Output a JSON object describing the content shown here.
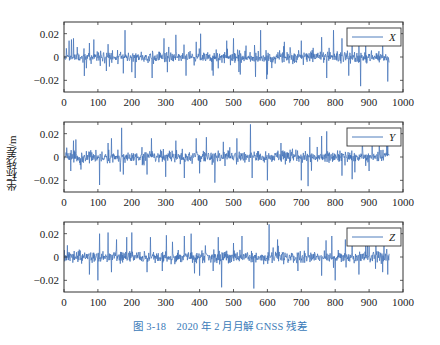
{
  "figure": {
    "caption": "图 3-18　2020 年 2 月月解 GNSS 残差",
    "ylabel": "坐标残差/m",
    "line_color": "#3d6fb6",
    "axis_color": "#333333",
    "caption_color": "#3a7ab8"
  },
  "chart_data": [
    {
      "type": "line",
      "title": "",
      "legend": "X",
      "xlabel": "",
      "ylabel": "坐标残差/m",
      "xlim": [
        0,
        1000
      ],
      "ylim": [
        -0.03,
        0.03
      ],
      "xticks": [
        0,
        100,
        200,
        300,
        400,
        500,
        600,
        700,
        800,
        900,
        1000
      ],
      "yticks": [
        -0.02,
        0,
        0.02
      ],
      "ytick_labels": [
        "-0.02",
        "0",
        "0.02"
      ],
      "n_points": 960,
      "noise_std": 0.003,
      "seed": 11,
      "spikes": [
        [
          15,
          0.014
        ],
        [
          22,
          0.015
        ],
        [
          28,
          0.016
        ],
        [
          75,
          0.012
        ],
        [
          88,
          0.015
        ],
        [
          125,
          -0.012
        ],
        [
          130,
          0.011
        ],
        [
          175,
          -0.014
        ],
        [
          180,
          0.023
        ],
        [
          200,
          -0.013
        ],
        [
          210,
          -0.018
        ],
        [
          260,
          -0.018
        ],
        [
          295,
          0.016
        ],
        [
          305,
          -0.013
        ],
        [
          330,
          0.019
        ],
        [
          360,
          -0.016
        ],
        [
          390,
          0.013
        ],
        [
          440,
          -0.016
        ],
        [
          480,
          0.014
        ],
        [
          500,
          0.016
        ],
        [
          520,
          -0.015
        ],
        [
          580,
          0.023
        ],
        [
          565,
          -0.017
        ],
        [
          600,
          -0.015
        ],
        [
          650,
          0.013
        ],
        [
          700,
          0.014
        ],
        [
          760,
          0.017
        ],
        [
          775,
          -0.018
        ],
        [
          795,
          0.023
        ],
        [
          820,
          0.016
        ],
        [
          840,
          -0.016
        ],
        [
          850,
          0.015
        ],
        [
          875,
          -0.025
        ],
        [
          890,
          0.016
        ],
        [
          940,
          0.015
        ],
        [
          955,
          -0.021
        ]
      ]
    },
    {
      "type": "line",
      "legend": "Y",
      "xlim": [
        0,
        1000
      ],
      "ylim": [
        -0.03,
        0.03
      ],
      "xticks": [
        0,
        100,
        200,
        300,
        400,
        500,
        600,
        700,
        800,
        900,
        1000
      ],
      "yticks": [
        -0.02,
        0,
        0.02
      ],
      "ytick_labels": [
        "-0.02",
        "0",
        "0.02"
      ],
      "n_points": 960,
      "noise_std": 0.003,
      "seed": 23,
      "spikes": [
        [
          8,
          0.008
        ],
        [
          20,
          -0.012
        ],
        [
          28,
          0.014
        ],
        [
          35,
          0.015
        ],
        [
          105,
          -0.024
        ],
        [
          130,
          0.012
        ],
        [
          140,
          0.016
        ],
        [
          170,
          0.025
        ],
        [
          175,
          -0.015
        ],
        [
          245,
          -0.015
        ],
        [
          258,
          0.016
        ],
        [
          300,
          -0.017
        ],
        [
          330,
          0.014
        ],
        [
          355,
          -0.018
        ],
        [
          390,
          0.016
        ],
        [
          400,
          -0.014
        ],
        [
          420,
          0.017
        ],
        [
          445,
          -0.022
        ],
        [
          470,
          0.013
        ],
        [
          510,
          0.016
        ],
        [
          550,
          0.028
        ],
        [
          555,
          -0.018
        ],
        [
          600,
          -0.02
        ],
        [
          640,
          0.012
        ],
        [
          700,
          -0.02
        ],
        [
          720,
          -0.025
        ],
        [
          725,
          0.017
        ],
        [
          760,
          0.018
        ],
        [
          775,
          0.022
        ],
        [
          820,
          -0.016
        ],
        [
          850,
          -0.019
        ],
        [
          880,
          0.016
        ],
        [
          900,
          -0.012
        ],
        [
          930,
          0.014
        ],
        [
          955,
          0.01
        ]
      ]
    },
    {
      "type": "line",
      "legend": "Z",
      "xlim": [
        0,
        1000
      ],
      "ylim": [
        -0.03,
        0.03
      ],
      "xticks": [
        0,
        100,
        200,
        300,
        400,
        500,
        600,
        700,
        800,
        900,
        1000
      ],
      "yticks": [
        -0.02,
        0,
        0.02
      ],
      "ytick_labels": [
        "-0.02",
        "0",
        "0.02"
      ],
      "n_points": 960,
      "noise_std": 0.003,
      "seed": 37,
      "spikes": [
        [
          10,
          0.01
        ],
        [
          75,
          -0.015
        ],
        [
          100,
          -0.02
        ],
        [
          105,
          0.02
        ],
        [
          130,
          0.021
        ],
        [
          140,
          -0.013
        ],
        [
          155,
          0.015
        ],
        [
          185,
          0.017
        ],
        [
          200,
          0.021
        ],
        [
          245,
          -0.013
        ],
        [
          255,
          0.017
        ],
        [
          290,
          -0.012
        ],
        [
          320,
          0.013
        ],
        [
          355,
          0.018
        ],
        [
          375,
          0.02
        ],
        [
          385,
          -0.014
        ],
        [
          400,
          -0.016
        ],
        [
          440,
          -0.012
        ],
        [
          455,
          0.017
        ],
        [
          465,
          -0.026
        ],
        [
          500,
          0.012
        ],
        [
          525,
          0.018
        ],
        [
          560,
          -0.027
        ],
        [
          605,
          0.028
        ],
        [
          630,
          0.015
        ],
        [
          690,
          -0.012
        ],
        [
          720,
          0.017
        ],
        [
          760,
          -0.016
        ],
        [
          790,
          0.018
        ],
        [
          800,
          -0.02
        ],
        [
          830,
          0.015
        ],
        [
          850,
          0.016
        ],
        [
          870,
          -0.015
        ],
        [
          895,
          0.014
        ],
        [
          920,
          0.012
        ],
        [
          940,
          -0.013
        ],
        [
          955,
          -0.015
        ]
      ]
    }
  ]
}
